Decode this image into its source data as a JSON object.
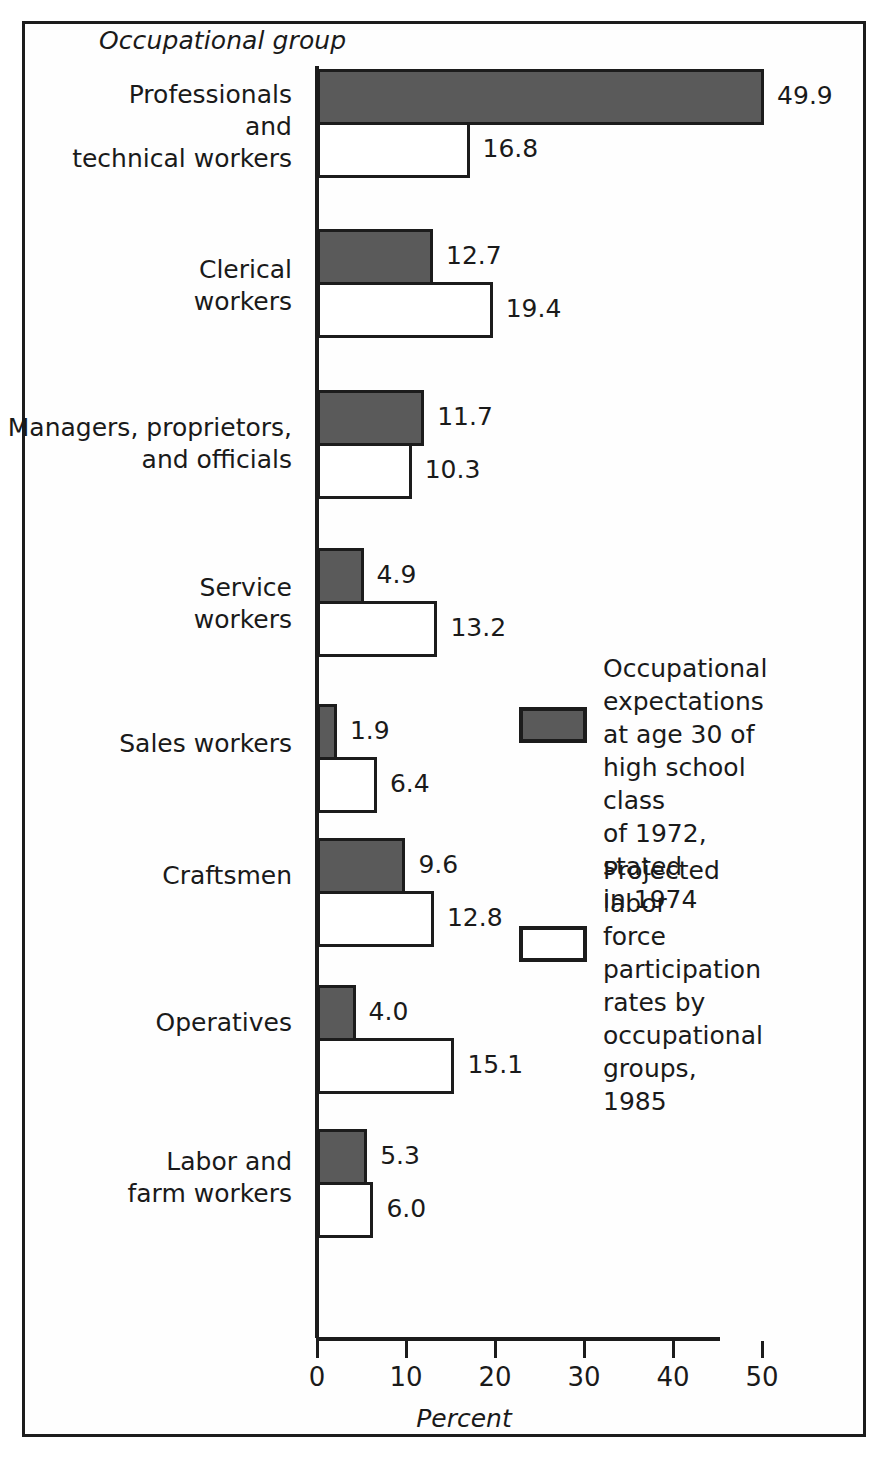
{
  "figure": {
    "axis_title_y": "Occupational group",
    "axis_title_x": "Percent"
  },
  "chart_data": {
    "type": "bar",
    "orientation": "horizontal",
    "title": "",
    "xlabel": "Percent",
    "ylabel": "Occupational group",
    "xlim": [
      0,
      50
    ],
    "xticks": [
      0,
      10,
      20,
      30,
      40,
      50
    ],
    "xtick_labels": [
      "0",
      "10",
      "20",
      "30",
      "40",
      "50"
    ],
    "grid": false,
    "legend_position": "right-middle",
    "categories": [
      "Professionals\nand\ntechnical workers",
      "Clerical\nworkers",
      "Managers, proprietors,\nand officials",
      "Service\nworkers",
      "Sales workers",
      "Craftsmen",
      "Operatives",
      "Labor and\nfarm workers"
    ],
    "series": [
      {
        "name": "Occupational expectations at age 30 of high school class of 1972, stated in 1974",
        "style": "dark-gray-filled",
        "color": "#5a5a5a",
        "values": [
          49.9,
          12.7,
          11.7,
          4.9,
          1.9,
          9.6,
          4.0,
          5.3
        ],
        "labels": [
          "49.9",
          "12.7",
          "11.7",
          "4.9",
          "1.9",
          "9.6",
          "4.0",
          "5.3"
        ]
      },
      {
        "name": "Projected labor force participation rates by occupational groups, 1985",
        "style": "white-outlined",
        "color": "#ffffff",
        "values": [
          16.8,
          19.4,
          10.3,
          13.2,
          6.4,
          12.8,
          15.1,
          6.0
        ],
        "labels": [
          "16.8",
          "19.4",
          "10.3",
          "13.2",
          "6.4",
          "12.8",
          "15.1",
          "6.0"
        ]
      }
    ]
  },
  "legend": {
    "entries": [
      {
        "swatch": "dark",
        "text": "Occupational\nexpectations\nat age 30 of\nhigh school class\nof 1972, stated\nin 1974"
      },
      {
        "swatch": "light",
        "text": "Projected labor\nforce participation\nrates by\noccupational\ngroups, 1985"
      }
    ]
  }
}
